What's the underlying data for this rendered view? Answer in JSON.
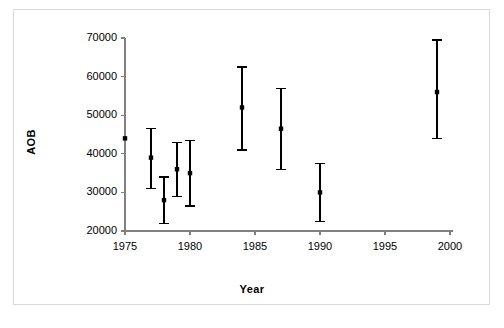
{
  "chart_data": {
    "type": "scatter",
    "title": "",
    "subtitle": "",
    "xlabel": "Year",
    "ylabel": "AOB",
    "grid": false,
    "legend": false,
    "legend_position": "none",
    "xlim": [
      1974,
      2000
    ],
    "ylim": [
      20000,
      70000
    ],
    "xticks": [
      1975,
      1980,
      1985,
      1990,
      1995,
      2000
    ],
    "xtick_labels": [
      "1975",
      "1980",
      "1985",
      "1990",
      "1995",
      "2000"
    ],
    "yticks": [
      20000,
      30000,
      40000,
      50000,
      60000,
      70000
    ],
    "ytick_labels": [
      "20000",
      "30000",
      "40000",
      "50000",
      "60000",
      "70000"
    ],
    "marker": "filled-square",
    "marker_color": "#000000",
    "errorbar_color": "#000000",
    "axis_color": "#808080",
    "series": [
      {
        "name": "AOB",
        "x": [
          1975,
          1977,
          1978,
          1979,
          1980,
          1984,
          1987,
          1990,
          1999
        ],
        "values": [
          44000,
          39000,
          28000,
          36000,
          35000,
          52000,
          46500,
          30000,
          56000
        ],
        "lower": [
          44000,
          31000,
          22000,
          29000,
          26500,
          41000,
          36000,
          22500,
          44000
        ],
        "upper": [
          44000,
          46500,
          34000,
          43000,
          43500,
          62500,
          57000,
          37500,
          69500
        ]
      }
    ],
    "points": [
      {
        "year": 1975,
        "value": 44000,
        "lower": 44000,
        "upper": 44000
      },
      {
        "year": 1977,
        "value": 39000,
        "lower": 31000,
        "upper": 46500
      },
      {
        "year": 1978,
        "value": 28000,
        "lower": 22000,
        "upper": 34000
      },
      {
        "year": 1979,
        "value": 36000,
        "lower": 29000,
        "upper": 43000
      },
      {
        "year": 1980,
        "value": 35000,
        "lower": 26500,
        "upper": 43500
      },
      {
        "year": 1984,
        "value": 52000,
        "lower": 41000,
        "upper": 62500
      },
      {
        "year": 1987,
        "value": 46500,
        "lower": 36000,
        "upper": 57000
      },
      {
        "year": 1990,
        "value": 30000,
        "lower": 22500,
        "upper": 37500
      },
      {
        "year": 1999,
        "value": 56000,
        "lower": 44000,
        "upper": 69500
      }
    ]
  }
}
